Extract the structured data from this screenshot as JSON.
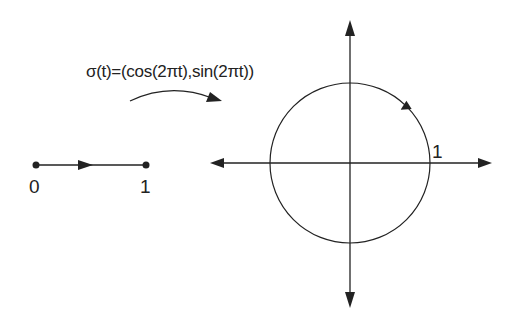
{
  "diagram": {
    "formula": "σ(t)=(cos(2πt),sin(2πt))",
    "interval": {
      "start_label": "0",
      "end_label": "1"
    },
    "circle": {
      "radius_label": "1"
    },
    "colors": {
      "stroke": "#222222",
      "background": "#ffffff"
    }
  }
}
